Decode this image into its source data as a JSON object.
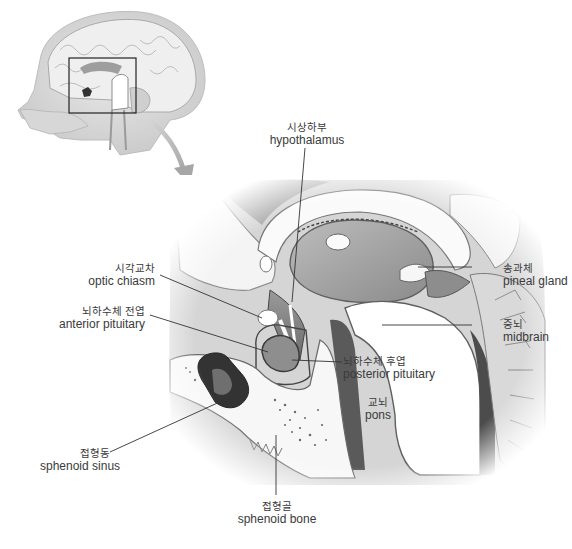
{
  "figure": {
    "type": "anatomical-diagram",
    "inset": {
      "description": "head sagittal view with zoom box",
      "box": [
        69,
        58,
        136,
        113
      ]
    },
    "labels": [
      {
        "id": "hypothalamus",
        "ko": "시상하부",
        "en": "hypothalamus"
      },
      {
        "id": "optic-chiasm",
        "ko": "시각교차",
        "en": "optic chiasm"
      },
      {
        "id": "anterior-pituitary",
        "ko": "뇌하수체 전엽",
        "en": "anterior pituitary"
      },
      {
        "id": "pineal-gland",
        "ko": "송과체",
        "en": "pineal gland"
      },
      {
        "id": "midbrain",
        "ko": "중뇌",
        "en": "midbrain"
      },
      {
        "id": "posterior-pituitary",
        "ko": "뇌하수체 후엽",
        "en": "posterior pituitary"
      },
      {
        "id": "pons",
        "ko": "교뇌",
        "en": "pons"
      },
      {
        "id": "sphenoid-sinus",
        "ko": "접형동",
        "en": "sphenoid sinus"
      },
      {
        "id": "sphenoid-bone",
        "ko": "접형골",
        "en": "sphenoid bone"
      }
    ]
  }
}
